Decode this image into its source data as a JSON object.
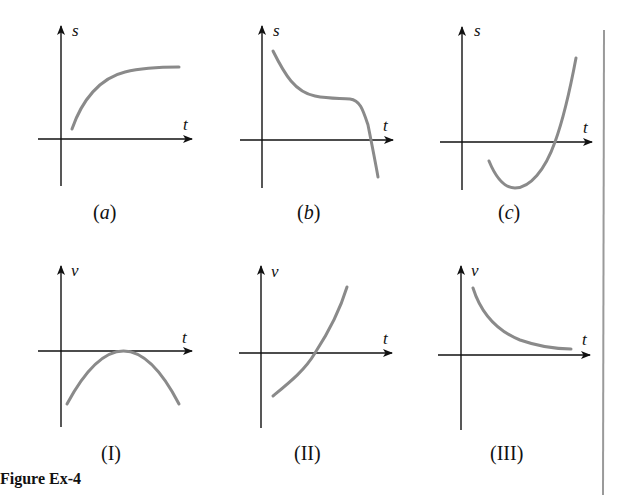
{
  "figure": {
    "caption": "Figure Ex-4",
    "top_row_axis_label_y": "s",
    "bottom_row_axis_label_y": "v",
    "axis_label_x": "t",
    "panels": [
      {
        "id": "a",
        "label_open": "(",
        "label_text": "a",
        "label_close": ")",
        "y_axis": "s",
        "x_axis": "t",
        "shape": "increasing concave-down, leveling off to horizontal asymptote"
      },
      {
        "id": "b",
        "label_open": "(",
        "label_text": "b",
        "label_close": ")",
        "y_axis": "s",
        "x_axis": "t",
        "shape": "decreasing, flat inflection plateau, then dropping below t-axis"
      },
      {
        "id": "c",
        "label_open": "(",
        "label_text": "c",
        "label_close": ")",
        "y_axis": "s",
        "x_axis": "t",
        "shape": "starts below t-axis, dips to minimum, rises steeply crossing t-axis"
      },
      {
        "id": "I",
        "label": "(I)",
        "y_axis": "v",
        "x_axis": "t",
        "shape": "downward parabola touching t-axis at its maximum"
      },
      {
        "id": "II",
        "label": "(II)",
        "y_axis": "v",
        "x_axis": "t",
        "shape": "increasing from negative, crossing t-axis, concave up"
      },
      {
        "id": "III",
        "label": "(III)",
        "y_axis": "v",
        "x_axis": "t",
        "shape": "positive decreasing, decaying toward t-axis"
      }
    ]
  },
  "colors": {
    "axis": "#111111",
    "curve": "#8a8a8a",
    "rule": "#9a9a9a",
    "background": "#ffffff"
  }
}
